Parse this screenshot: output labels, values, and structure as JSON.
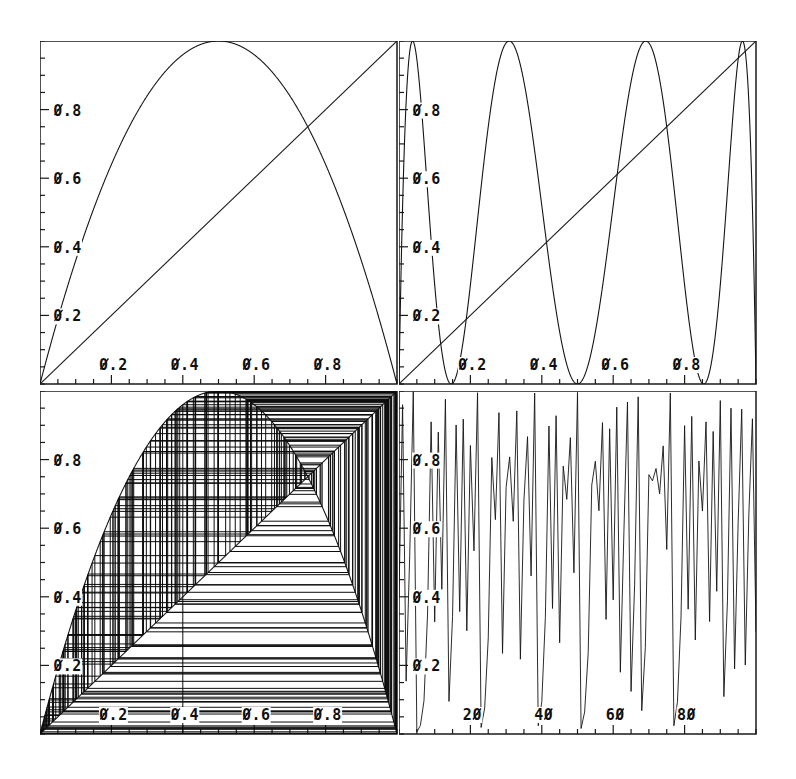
{
  "figure": {
    "width": 796,
    "height": 779,
    "background": "#ffffff",
    "ink": "#141414",
    "style": "dot-matrix line plot, slashed zeros"
  },
  "panels": [
    {
      "id": "map-f1",
      "name": "logistic-map-f1",
      "position": "top-left",
      "x": 41,
      "y": 42,
      "w": 357,
      "h": 343,
      "x_ticks": [
        "0.2",
        "0.4",
        "0.6",
        "0.8"
      ],
      "x_tick_values": [
        0.2,
        0.4,
        0.6,
        0.8
      ],
      "y_ticks": [
        "0.2",
        "0.4",
        "0.6",
        "0.8"
      ],
      "y_tick_values": [
        0.2,
        0.4,
        0.6,
        0.8
      ],
      "minor_tick_step": 0.05,
      "xlim": [
        0,
        1
      ],
      "ylim": [
        0,
        1
      ],
      "has_diagonal": true,
      "iterate": 1
    },
    {
      "id": "map-f3",
      "name": "logistic-map-f3",
      "position": "top-right",
      "x": 400,
      "y": 42,
      "w": 357,
      "h": 343,
      "x_ticks": [
        "0.2",
        "0.4",
        "0.6",
        "0.8"
      ],
      "x_tick_values": [
        0.2,
        0.4,
        0.6,
        0.8
      ],
      "y_ticks": [
        "0.2",
        "0.4",
        "0.6",
        "0.8"
      ],
      "y_tick_values": [
        0.2,
        0.4,
        0.6,
        0.8
      ],
      "minor_tick_step": 0.05,
      "xlim": [
        0,
        1
      ],
      "ylim": [
        0,
        1
      ],
      "has_diagonal": true,
      "iterate": 3
    },
    {
      "id": "cobweb",
      "name": "cobweb-diagram",
      "position": "bottom-left",
      "x": 41,
      "y": 392,
      "w": 357,
      "h": 343,
      "x_ticks": [
        "0.2",
        "0.4",
        "0.6",
        "0.8"
      ],
      "x_tick_values": [
        0.2,
        0.4,
        0.6,
        0.8
      ],
      "y_ticks": [
        "0.2",
        "0.4",
        "0.6",
        "0.8"
      ],
      "y_tick_values": [
        0.2,
        0.4,
        0.6,
        0.8
      ],
      "minor_tick_step": 0.05,
      "xlim": [
        0,
        1
      ],
      "ylim": [
        0,
        1
      ],
      "has_diagonal": true,
      "iterate": 1,
      "cobweb_x0": 0.4,
      "cobweb_steps": 220,
      "fixed_point": 0.75
    },
    {
      "id": "timeseries",
      "name": "time-series-plot",
      "position": "bottom-right",
      "x": 400,
      "y": 392,
      "w": 357,
      "h": 343,
      "x_ticks": [
        "20",
        "40",
        "60",
        "80"
      ],
      "x_tick_values": [
        20,
        40,
        60,
        80
      ],
      "y_ticks": [
        "0.2",
        "0.4",
        "0.6",
        "0.8"
      ],
      "y_tick_values": [
        0.2,
        0.4,
        0.6,
        0.8
      ],
      "minor_tick_step_x": 5,
      "minor_tick_step": 0.05,
      "xlim": [
        0,
        100
      ],
      "ylim": [
        0,
        1
      ]
    }
  ],
  "chart_data": [
    {
      "type": "line",
      "id": "map-f1",
      "title": "Logistic map f(x) = 4x(1-x)",
      "xlabel": "x",
      "ylabel": "f(x)",
      "xlim": [
        0,
        1
      ],
      "ylim": [
        0,
        1
      ],
      "grid": false,
      "legend": "none",
      "series": [
        {
          "name": "f(x)=4x(1-x)",
          "kind": "parabola",
          "r": 4,
          "iterate": 1
        },
        {
          "name": "y=x",
          "kind": "diagonal"
        }
      ],
      "annotations": [
        "peak at x=0.5, y=1.0",
        "fixed point at x=0.75"
      ]
    },
    {
      "type": "line",
      "id": "map-f3",
      "title": "Third iterate f^3(x)",
      "xlabel": "x",
      "ylabel": "f^3(x)",
      "xlim": [
        0,
        1
      ],
      "ylim": [
        0,
        1
      ],
      "grid": false,
      "legend": "none",
      "series": [
        {
          "name": "f^3(x)",
          "kind": "iterate",
          "r": 4,
          "iterate": 3
        },
        {
          "name": "y=x",
          "kind": "diagonal"
        }
      ],
      "annotations": [
        "4 maxima",
        "8 intersections with y=x (period-3 orbits + fixed points)"
      ]
    },
    {
      "type": "line",
      "id": "cobweb",
      "title": "Cobweb / staircase iteration of f(x)=4x(1-x)",
      "xlabel": "x_n",
      "ylabel": "x_n+1",
      "xlim": [
        0,
        1
      ],
      "ylim": [
        0,
        1
      ],
      "grid": false,
      "legend": "none",
      "series": [
        {
          "name": "f(x)=4x(1-x)",
          "kind": "parabola",
          "r": 4,
          "iterate": 1
        },
        {
          "name": "y=x",
          "kind": "diagonal"
        },
        {
          "name": "cobweb orbit",
          "kind": "cobweb",
          "x0": 0.4,
          "steps": 220
        }
      ],
      "annotations": [
        "orbit spirals densely around unstable fixed point x*=0.75"
      ]
    },
    {
      "type": "line",
      "id": "timeseries",
      "title": "Time series x_n of the chaotic logistic map",
      "xlabel": "n",
      "ylabel": "x_n",
      "xlim": [
        0,
        100
      ],
      "ylim": [
        0,
        1
      ],
      "grid": false,
      "legend": "none",
      "series": [
        {
          "name": "x_n",
          "kind": "orbit",
          "r": 4,
          "x0": 0.4,
          "n": 101,
          "values": [
            0.4,
            0.96,
            0.154,
            0.52,
            0.998,
            0.006,
            0.025,
            0.097,
            0.35,
            0.91,
            0.327,
            0.88,
            0.422,
            0.976,
            0.095,
            0.343,
            0.901,
            0.357,
            0.918,
            0.301,
            0.841,
            0.534,
            0.995,
            0.019,
            0.076,
            0.28,
            0.806,
            0.625,
            0.937,
            0.235,
            0.719,
            0.808,
            0.62,
            0.942,
            0.218,
            0.682,
            0.867,
            0.461,
            0.994,
            0.024,
            0.094,
            0.34,
            0.898,
            0.366,
            0.928,
            0.266,
            0.781,
            0.684,
            0.864,
            0.47,
            0.996,
            0.016,
            0.064,
            0.238,
            0.726,
            0.795,
            0.651,
            0.908,
            0.334,
            0.89,
            0.391,
            0.953,
            0.18,
            0.59,
            0.968,
            0.124,
            0.434,
            0.983,
            0.068,
            0.253,
            0.756,
            0.738,
            0.774,
            0.7,
            0.84,
            0.538,
            0.994,
            0.024,
            0.094,
            0.341,
            0.899,
            0.364,
            0.926,
            0.274,
            0.796,
            0.65,
            0.91,
            0.328,
            0.882,
            0.416,
            0.972,
            0.109,
            0.388,
            0.95,
            0.19,
            0.616,
            0.947,
            0.201,
            0.642,
            0.919,
            0.298
          ]
        }
      ],
      "annotations": [
        "laminar / near-fixed-point episode around n=48-55",
        "otherwise fully chaotic"
      ]
    }
  ],
  "axis_label_font": {
    "slashed_zero": true,
    "size_px": 15,
    "weight": "bold"
  }
}
